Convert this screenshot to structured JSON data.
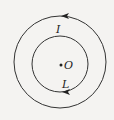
{
  "diagram": {
    "center": {
      "label": "O",
      "x": 60,
      "y": 64
    },
    "outer_circle": {
      "radius": 46,
      "label": "I",
      "arrow": "counterclockwise (top, pointing left)"
    },
    "inner_circle": {
      "radius": 28,
      "label": "L",
      "arrow": "at bottom, pointing left"
    },
    "colors": {
      "stroke": "#333333",
      "background": "#f4f3f1"
    }
  }
}
